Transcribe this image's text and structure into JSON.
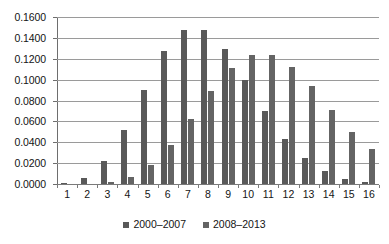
{
  "chart_data": {
    "type": "bar",
    "title": "",
    "subtitle": "",
    "xlabel": "",
    "ylabel": "",
    "ylim": [
      0.0,
      0.16
    ],
    "ytick_labels": [
      "0.1600",
      "0.1400",
      "0.1200",
      "0.1000",
      "0.0800",
      "0.0600",
      "0.0400",
      "0.0200",
      "0.0000"
    ],
    "ytick_values": [
      0.16,
      0.14,
      0.12,
      0.1,
      0.08,
      0.06,
      0.04,
      0.02,
      0.0
    ],
    "grid": true,
    "legend_position": "bottom",
    "categories": [
      "1",
      "2",
      "3",
      "4",
      "5",
      "6",
      "7",
      "8",
      "9",
      "10",
      "11",
      "12",
      "13",
      "14",
      "15",
      "16"
    ],
    "series": [
      {
        "name": "2000–2007",
        "color": "#595959",
        "values": [
          0.0003,
          0.0055,
          0.022,
          0.0515,
          0.09,
          0.127,
          0.148,
          0.148,
          0.129,
          0.1,
          0.0695,
          0.0435,
          0.025,
          0.0125,
          0.0045,
          0.0015
        ]
      },
      {
        "name": "2008–2013",
        "color": "#646464",
        "values": [
          0.0,
          0.0,
          0.0015,
          0.0065,
          0.0185,
          0.037,
          0.0625,
          0.089,
          0.1115,
          0.1235,
          0.1235,
          0.112,
          0.0935,
          0.071,
          0.05,
          0.0335
        ]
      }
    ]
  },
  "legend": {
    "items": [
      {
        "label": "2000–2007",
        "swatch_name": "legend-swatch-2000-2007"
      },
      {
        "label": "2008–2013",
        "swatch_name": "legend-swatch-2008-2013"
      }
    ]
  },
  "colors": {
    "series_1": "#595959",
    "series_2": "#646464",
    "gridline": "#9a9a9a",
    "axis": "#6e6e6e",
    "text": "#141414",
    "background": "#ffffff"
  }
}
